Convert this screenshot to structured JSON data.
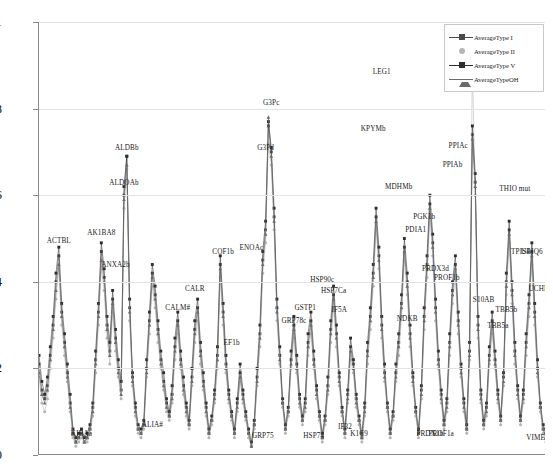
{
  "chart_data": {
    "type": "line",
    "title": "",
    "xlabel": "",
    "ylabel": "",
    "ylim": [
      0,
      1
    ],
    "yticks": [
      "0",
      "0.2",
      "0.4",
      "0.6",
      "0.8",
      "1"
    ],
    "ytick_values": [
      0,
      0.2,
      0.4,
      0.6,
      0.8,
      1
    ],
    "xlim": [
      0,
      180
    ],
    "grid": true,
    "xtick_labels": [],
    "legend_position": "top-right",
    "colors": {
      "AverageType I": "#4a4a4a",
      "AverageType II": "#b5b5b5",
      "AverageType V": "#2e2e2e",
      "AverageTypeOH": "#6b6b6b"
    },
    "markers": {
      "AverageType I": "square",
      "AverageType II": "circle",
      "AverageType V": "square",
      "AverageTypeOH": "triangle"
    },
    "series": [
      {
        "name": "AverageType I",
        "values": [
          0.21,
          0.15,
          0.13,
          0.16,
          0.23,
          0.3,
          0.4,
          0.46,
          0.33,
          0.26,
          0.19,
          0.12,
          0.05,
          0.03,
          0.04,
          0.05,
          0.03,
          0.04,
          0.06,
          0.11,
          0.22,
          0.33,
          0.47,
          0.41,
          0.3,
          0.24,
          0.36,
          0.27,
          0.2,
          0.15,
          0.6,
          0.69,
          0.34,
          0.18,
          0.11,
          0.06,
          0.05,
          0.07,
          0.2,
          0.31,
          0.42,
          0.37,
          0.29,
          0.22,
          0.17,
          0.12,
          0.09,
          0.14,
          0.25,
          0.31,
          0.22,
          0.16,
          0.11,
          0.07,
          0.18,
          0.29,
          0.34,
          0.24,
          0.17,
          0.11,
          0.05,
          0.08,
          0.14,
          0.23,
          0.44,
          0.33,
          0.21,
          0.14,
          0.09,
          0.05,
          0.12,
          0.19,
          0.14,
          0.09,
          0.05,
          0.02,
          0.07,
          0.18,
          0.28,
          0.45,
          0.52,
          0.76,
          0.7,
          0.55,
          0.34,
          0.23,
          0.12,
          0.06,
          0.1,
          0.22,
          0.3,
          0.21,
          0.13,
          0.08,
          0.12,
          0.26,
          0.31,
          0.22,
          0.15,
          0.09,
          0.04,
          0.08,
          0.16,
          0.29,
          0.37,
          0.28,
          0.18,
          0.1,
          0.05,
          0.14,
          0.25,
          0.21,
          0.13,
          0.08,
          0.04,
          0.11,
          0.24,
          0.32,
          0.42,
          0.55,
          0.46,
          0.3,
          0.19,
          0.11,
          0.05,
          0.09,
          0.19,
          0.26,
          0.35,
          0.48,
          0.4,
          0.28,
          0.18,
          0.1,
          0.05,
          0.15,
          0.32,
          0.44,
          0.58,
          0.49,
          0.34,
          0.22,
          0.14,
          0.07,
          0.12,
          0.26,
          0.38,
          0.44,
          0.31,
          0.2,
          0.12,
          0.06,
          0.24,
          0.74,
          0.63,
          0.3,
          0.14,
          0.07,
          0.11,
          0.23,
          0.31,
          0.22,
          0.14,
          0.08,
          0.18,
          0.4,
          0.52,
          0.38,
          0.24,
          0.15,
          0.08,
          0.14,
          0.26,
          0.35,
          0.47,
          0.33,
          0.2,
          0.11,
          0.06,
          0.04
        ]
      },
      {
        "name": "AverageType II",
        "values": [
          0.18,
          0.12,
          0.1,
          0.13,
          0.2,
          0.27,
          0.36,
          0.43,
          0.3,
          0.23,
          0.17,
          0.1,
          0.04,
          0.02,
          0.03,
          0.04,
          0.03,
          0.03,
          0.05,
          0.09,
          0.19,
          0.3,
          0.43,
          0.38,
          0.27,
          0.21,
          0.33,
          0.24,
          0.18,
          0.13,
          0.57,
          0.66,
          0.31,
          0.16,
          0.09,
          0.05,
          0.04,
          0.06,
          0.18,
          0.28,
          0.39,
          0.34,
          0.26,
          0.2,
          0.15,
          0.1,
          0.08,
          0.12,
          0.22,
          0.28,
          0.2,
          0.14,
          0.09,
          0.06,
          0.16,
          0.26,
          0.31,
          0.21,
          0.15,
          0.09,
          0.04,
          0.07,
          0.12,
          0.2,
          0.41,
          0.3,
          0.19,
          0.12,
          0.08,
          0.04,
          0.1,
          0.17,
          0.12,
          0.08,
          0.04,
          0.02,
          0.06,
          0.16,
          0.25,
          0.42,
          0.49,
          0.72,
          0.67,
          0.52,
          0.31,
          0.21,
          0.11,
          0.05,
          0.09,
          0.2,
          0.27,
          0.19,
          0.11,
          0.07,
          0.1,
          0.23,
          0.28,
          0.2,
          0.13,
          0.08,
          0.03,
          0.07,
          0.14,
          0.26,
          0.34,
          0.25,
          0.16,
          0.09,
          0.04,
          0.12,
          0.22,
          0.19,
          0.11,
          0.07,
          0.03,
          0.09,
          0.21,
          0.29,
          0.39,
          0.52,
          0.43,
          0.27,
          0.17,
          0.1,
          0.04,
          0.08,
          0.17,
          0.23,
          0.32,
          0.45,
          0.37,
          0.25,
          0.16,
          0.09,
          0.04,
          0.13,
          0.29,
          0.41,
          0.55,
          0.46,
          0.31,
          0.2,
          0.12,
          0.06,
          0.1,
          0.23,
          0.35,
          0.41,
          0.28,
          0.18,
          0.1,
          0.05,
          0.22,
          0.91,
          0.6,
          0.27,
          0.12,
          0.06,
          0.09,
          0.21,
          0.28,
          0.2,
          0.12,
          0.07,
          0.16,
          0.37,
          0.49,
          0.35,
          0.21,
          0.13,
          0.07,
          0.12,
          0.23,
          0.32,
          0.44,
          0.3,
          0.18,
          0.1,
          0.05,
          0.03
        ]
      },
      {
        "name": "AverageType V",
        "values": [
          0.23,
          0.17,
          0.14,
          0.18,
          0.25,
          0.32,
          0.42,
          0.48,
          0.35,
          0.28,
          0.21,
          0.14,
          0.06,
          0.04,
          0.05,
          0.06,
          0.04,
          0.05,
          0.07,
          0.12,
          0.24,
          0.35,
          0.49,
          0.43,
          0.32,
          0.26,
          0.38,
          0.29,
          0.22,
          0.17,
          0.62,
          0.69,
          0.36,
          0.19,
          0.12,
          0.07,
          0.06,
          0.08,
          0.22,
          0.33,
          0.44,
          0.39,
          0.31,
          0.24,
          0.19,
          0.13,
          0.1,
          0.16,
          0.27,
          0.33,
          0.24,
          0.18,
          0.12,
          0.08,
          0.2,
          0.31,
          0.36,
          0.26,
          0.19,
          0.12,
          0.06,
          0.09,
          0.15,
          0.25,
          0.46,
          0.35,
          0.23,
          0.15,
          0.1,
          0.06,
          0.13,
          0.21,
          0.15,
          0.1,
          0.06,
          0.03,
          0.08,
          0.2,
          0.3,
          0.47,
          0.54,
          0.77,
          0.71,
          0.57,
          0.36,
          0.25,
          0.13,
          0.07,
          0.11,
          0.24,
          0.32,
          0.23,
          0.14,
          0.09,
          0.13,
          0.28,
          0.33,
          0.24,
          0.16,
          0.1,
          0.05,
          0.09,
          0.18,
          0.31,
          0.39,
          0.3,
          0.19,
          0.11,
          0.06,
          0.15,
          0.27,
          0.22,
          0.14,
          0.09,
          0.05,
          0.12,
          0.26,
          0.34,
          0.44,
          0.57,
          0.48,
          0.32,
          0.21,
          0.12,
          0.06,
          0.1,
          0.21,
          0.28,
          0.37,
          0.5,
          0.42,
          0.3,
          0.19,
          0.11,
          0.06,
          0.16,
          0.34,
          0.46,
          0.6,
          0.51,
          0.36,
          0.24,
          0.15,
          0.08,
          0.13,
          0.28,
          0.4,
          0.46,
          0.33,
          0.21,
          0.13,
          0.07,
          0.26,
          0.76,
          0.65,
          0.32,
          0.15,
          0.08,
          0.12,
          0.25,
          0.33,
          0.24,
          0.15,
          0.09,
          0.19,
          0.42,
          0.54,
          0.4,
          0.26,
          0.16,
          0.09,
          0.15,
          0.28,
          0.37,
          0.49,
          0.35,
          0.22,
          0.12,
          0.07,
          0.05
        ]
      },
      {
        "name": "AverageTypeOH",
        "values": [
          0.19,
          0.14,
          0.12,
          0.15,
          0.22,
          0.29,
          0.38,
          0.44,
          0.32,
          0.25,
          0.18,
          0.11,
          0.05,
          0.03,
          0.04,
          0.05,
          0.03,
          0.04,
          0.06,
          0.1,
          0.21,
          0.32,
          0.45,
          0.4,
          0.29,
          0.23,
          0.35,
          0.26,
          0.19,
          0.14,
          0.59,
          0.67,
          0.33,
          0.17,
          0.1,
          0.06,
          0.05,
          0.07,
          0.19,
          0.3,
          0.41,
          0.36,
          0.28,
          0.21,
          0.16,
          0.11,
          0.09,
          0.13,
          0.24,
          0.3,
          0.21,
          0.15,
          0.1,
          0.07,
          0.17,
          0.28,
          0.33,
          0.23,
          0.16,
          0.1,
          0.05,
          0.08,
          0.13,
          0.22,
          0.43,
          0.32,
          0.2,
          0.13,
          0.09,
          0.05,
          0.11,
          0.18,
          0.13,
          0.09,
          0.05,
          0.02,
          0.07,
          0.17,
          0.27,
          0.44,
          0.51,
          0.78,
          0.69,
          0.54,
          0.33,
          0.22,
          0.12,
          0.06,
          0.1,
          0.21,
          0.29,
          0.2,
          0.12,
          0.08,
          0.11,
          0.25,
          0.3,
          0.21,
          0.14,
          0.09,
          0.04,
          0.08,
          0.15,
          0.28,
          0.36,
          0.27,
          0.17,
          0.1,
          0.05,
          0.13,
          0.24,
          0.2,
          0.12,
          0.08,
          0.04,
          0.1,
          0.23,
          0.31,
          0.41,
          0.54,
          0.45,
          0.29,
          0.18,
          0.11,
          0.05,
          0.09,
          0.18,
          0.25,
          0.34,
          0.47,
          0.39,
          0.27,
          0.17,
          0.1,
          0.05,
          0.14,
          0.31,
          0.43,
          0.57,
          0.48,
          0.33,
          0.21,
          0.13,
          0.07,
          0.11,
          0.25,
          0.37,
          0.43,
          0.3,
          0.19,
          0.11,
          0.06,
          0.23,
          0.73,
          0.62,
          0.29,
          0.13,
          0.07,
          0.1,
          0.22,
          0.3,
          0.21,
          0.13,
          0.08,
          0.17,
          0.39,
          0.51,
          0.37,
          0.23,
          0.14,
          0.08,
          0.13,
          0.25,
          0.34,
          0.46,
          0.32,
          0.19,
          0.11,
          0.06,
          0.04
        ]
      }
    ],
    "annotations": [
      {
        "label": "ACTBL",
        "x": 7,
        "y": 0.48
      },
      {
        "label": "KIBAa",
        "x": 15,
        "y": 0.035
      },
      {
        "label": "AK1BA8",
        "x": 22,
        "y": 0.5
      },
      {
        "label": "ANXA2b",
        "x": 27,
        "y": 0.425
      },
      {
        "label": "ALDOAb",
        "x": 30,
        "y": 0.615
      },
      {
        "label": "ALDBb",
        "x": 31,
        "y": 0.695
      },
      {
        "label": "ALIA#",
        "x": 40,
        "y": 0.055
      },
      {
        "label": "CALM#",
        "x": 49,
        "y": 0.325
      },
      {
        "label": "CALR",
        "x": 55,
        "y": 0.37
      },
      {
        "label": "COF1b",
        "x": 65,
        "y": 0.455
      },
      {
        "label": "EF1b",
        "x": 68,
        "y": 0.245
      },
      {
        "label": "ENOAc",
        "x": 75,
        "y": 0.465
      },
      {
        "label": "GRP75",
        "x": 79,
        "y": 0.03
      },
      {
        "label": "G3Pd",
        "x": 80,
        "y": 0.695
      },
      {
        "label": "G3Pc",
        "x": 82,
        "y": 0.8
      },
      {
        "label": "GRP78c",
        "x": 90,
        "y": 0.295
      },
      {
        "label": "GSTP1",
        "x": 94,
        "y": 0.325
      },
      {
        "label": "HSP74",
        "x": 97,
        "y": 0.03
      },
      {
        "label": "HSP90c",
        "x": 100,
        "y": 0.39
      },
      {
        "label": "HSP7Ca",
        "x": 104,
        "y": 0.365
      },
      {
        "label": "IF5A",
        "x": 106,
        "y": 0.32
      },
      {
        "label": "IF32",
        "x": 108,
        "y": 0.05
      },
      {
        "label": "K1C9",
        "x": 113,
        "y": 0.035
      },
      {
        "label": "KPYMb",
        "x": 118,
        "y": 0.74
      },
      {
        "label": "LEG1",
        "x": 121,
        "y": 0.87
      },
      {
        "label": "MDHMb",
        "x": 127,
        "y": 0.605
      },
      {
        "label": "NDKB",
        "x": 130,
        "y": 0.3
      },
      {
        "label": "PDIA1",
        "x": 133,
        "y": 0.505
      },
      {
        "label": "PGK1b",
        "x": 136,
        "y": 0.535
      },
      {
        "label": "PRDX1b",
        "x": 138,
        "y": 0.035
      },
      {
        "label": "PRDX3d",
        "x": 140,
        "y": 0.415
      },
      {
        "label": "PROF1a",
        "x": 142,
        "y": 0.035
      },
      {
        "label": "PROF1b",
        "x": 144,
        "y": 0.395
      },
      {
        "label": "PPIAb",
        "x": 146,
        "y": 0.655
      },
      {
        "label": "PPIAc",
        "x": 148,
        "y": 0.7
      },
      {
        "label": "S10A6/Mouse",
        "x": 154,
        "y": 0.94
      },
      {
        "label": "S10AB",
        "x": 157,
        "y": 0.345
      },
      {
        "label": "TBB5a",
        "x": 162,
        "y": 0.285
      },
      {
        "label": "TBB5b",
        "x": 165,
        "y": 0.32
      },
      {
        "label": "THIO mut",
        "x": 168,
        "y": 0.6
      },
      {
        "label": "TPIS4",
        "x": 170,
        "y": 0.455
      },
      {
        "label": "UBIQ6",
        "x": 174,
        "y": 0.455
      },
      {
        "label": "UCHL1",
        "x": 177,
        "y": 0.37
      },
      {
        "label": "VIMEd",
        "x": 176,
        "y": 0.025
      }
    ]
  },
  "legend": {
    "items": [
      {
        "label": "AverageType I",
        "color": "#4a4a4a",
        "marker": "square"
      },
      {
        "label": "AverageType II",
        "color": "#b5b5b5",
        "marker": "circle"
      },
      {
        "label": "AverageType V",
        "color": "#2e2e2e",
        "marker": "square"
      },
      {
        "label": "AverageTypeOH",
        "color": "#6b6b6b",
        "marker": "triangle"
      }
    ]
  }
}
